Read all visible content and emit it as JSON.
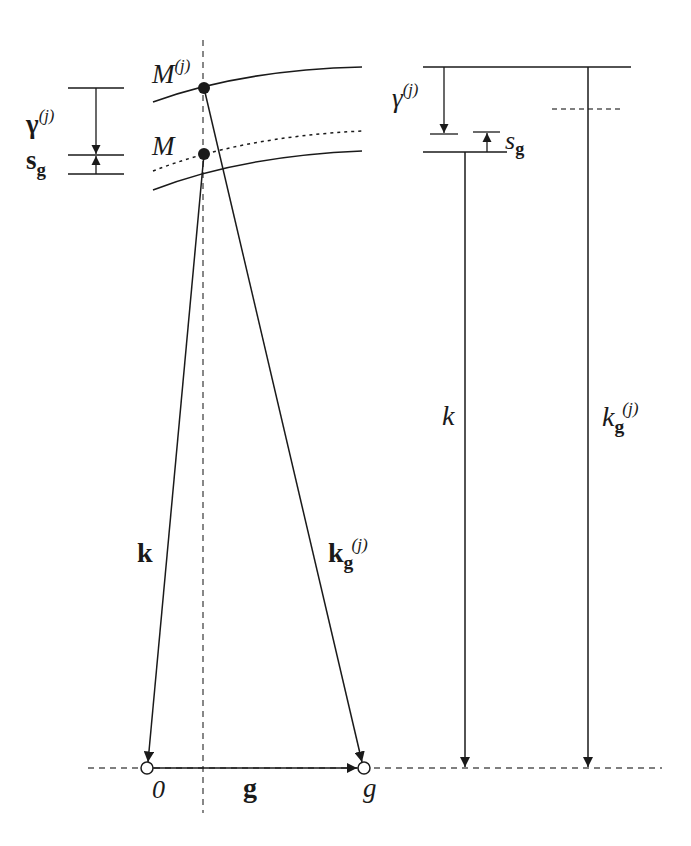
{
  "figure": {
    "type": "Ewald sphere / excitation error diagram",
    "colors": {
      "ink": "#1a1a1a",
      "dashed": "#555555",
      "background": "#ffffff"
    }
  },
  "labels": {
    "M_j": {
      "base": "M",
      "sup": "(j)"
    },
    "M": {
      "base": "M"
    },
    "gamma_left": {
      "base": "γ",
      "sup": "(j)"
    },
    "sg_left": {
      "base": "s",
      "sub": "g"
    },
    "gamma_right": {
      "base": "γ",
      "sup": "(j)"
    },
    "sg_right": {
      "base": "s",
      "sub": "g"
    },
    "k_vec": {
      "base": "k"
    },
    "kg_vec": {
      "base": "k",
      "sub": "g",
      "sup": "(j)"
    },
    "k_mag": {
      "base": "k"
    },
    "kg_mag": {
      "base": "k",
      "sub": "g",
      "sup": "(j)"
    },
    "origin": {
      "base": "0"
    },
    "g_vec": {
      "base": "g"
    },
    "g_point": {
      "base": "g"
    }
  }
}
